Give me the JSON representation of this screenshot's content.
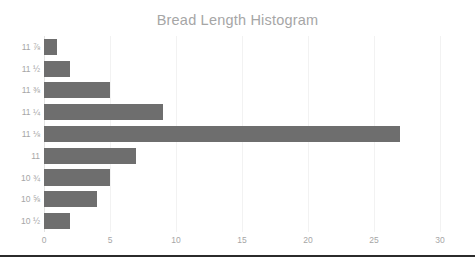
{
  "chart_data": {
    "type": "bar",
    "orientation": "horizontal",
    "title": "Bread Length Histogram",
    "xlabel": "",
    "ylabel": "",
    "categories": [
      "10 ½",
      "10 ⅝",
      "10 ¾",
      "11",
      "11 ⅛",
      "11 ¼",
      "11 ⅜",
      "11 ½",
      "11 ⅞"
    ],
    "values": [
      2,
      4,
      5,
      7,
      27,
      9,
      5,
      2,
      1
    ],
    "xlim": [
      0,
      30
    ],
    "xticks": [
      0,
      5,
      10,
      15,
      20,
      25,
      30
    ],
    "xtick_labels": [
      "0",
      "5",
      "10",
      "15",
      "20",
      "25",
      "30"
    ],
    "grid": "vertical",
    "legend": "none",
    "bar_color": "#6e6e6e",
    "title_color": "#a6a6a6",
    "label_color": "#a6a6a6",
    "gridline_color": "#f2f2f2",
    "background_color": "#ffffff",
    "rule_color": "#2b2b2b"
  }
}
